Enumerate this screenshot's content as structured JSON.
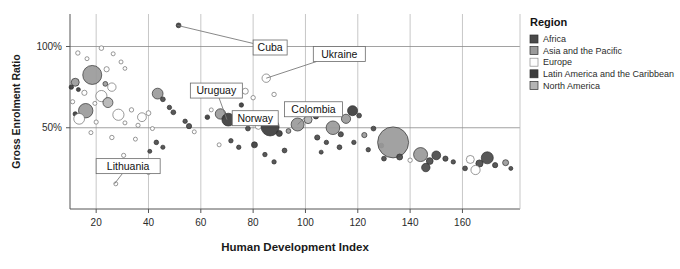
{
  "chart_data": {
    "type": "scatter",
    "title": "",
    "xlabel": "Human Development Index",
    "ylabel": "Gross Enrolment Ratio",
    "xlim": [
      10,
      182
    ],
    "ylim": [
      0,
      120
    ],
    "xticks": [
      20,
      40,
      60,
      80,
      100,
      120,
      140,
      160
    ],
    "xticklabels": [
      "20",
      "40",
      "60",
      "80",
      "100",
      "120",
      "140",
      "160"
    ],
    "yticks": [
      50,
      100
    ],
    "yticklabels": [
      "50%",
      "100%"
    ],
    "grid": "both",
    "legend_position": "right",
    "series": [
      {
        "name": "Africa",
        "color": "#4a4a4a"
      },
      {
        "name": "Asia and the Pacific",
        "color": "#9a9a9a"
      },
      {
        "name": "Europe",
        "color": "#ffffff"
      },
      {
        "name": "Latin America and the Caribbean",
        "color": "#3c3c3c"
      },
      {
        "name": "North America",
        "color": "#b5b5b5"
      }
    ],
    "annotations": [
      {
        "label": "Cuba",
        "x": 51.0,
        "y": 113.0,
        "box_x": 80.0,
        "box_y": 104.0
      },
      {
        "label": "Ukraine",
        "x": 85.0,
        "y": 80.5,
        "box_x": 103.0,
        "box_y": 100.0
      },
      {
        "label": "Uruguay",
        "x": 70.0,
        "y": 55.0,
        "box_x": 56.0,
        "box_y": 77.5
      },
      {
        "label": "Colombia",
        "x": 97.0,
        "y": 52.0,
        "box_x": 92.0,
        "box_y": 66.0
      },
      {
        "label": "Norway",
        "x": 82.0,
        "y": 51.0,
        "box_x": 72.0,
        "box_y": 60.5
      },
      {
        "label": "Lithuania",
        "x": 27.0,
        "y": 15.5,
        "box_x": 20.0,
        "box_y": 31.0
      }
    ],
    "points": [
      {
        "x": 13.0,
        "y": 96.0,
        "r": 2.2,
        "g": "Europe"
      },
      {
        "x": 16.5,
        "y": 92.5,
        "r": 2.0,
        "g": "Europe"
      },
      {
        "x": 22.0,
        "y": 99.0,
        "r": 2.3,
        "g": "Europe"
      },
      {
        "x": 26.5,
        "y": 95.5,
        "r": 2.0,
        "g": "Europe"
      },
      {
        "x": 29.5,
        "y": 90.5,
        "r": 2.0,
        "g": "Europe"
      },
      {
        "x": 24.0,
        "y": 86.0,
        "r": 2.6,
        "g": "Europe"
      },
      {
        "x": 31.0,
        "y": 86.5,
        "r": 1.9,
        "g": "Europe"
      },
      {
        "x": 18.5,
        "y": 82.5,
        "r": 9.5,
        "g": "Asia and the Pacific"
      },
      {
        "x": 23.5,
        "y": 77.0,
        "r": 2.4,
        "g": "Asia and the Pacific"
      },
      {
        "x": 12.0,
        "y": 78.0,
        "r": 4.0,
        "g": "Asia and the Pacific"
      },
      {
        "x": 10.5,
        "y": 75.0,
        "r": 2.2,
        "g": "Latin America and the Caribbean"
      },
      {
        "x": 13.2,
        "y": 73.5,
        "r": 2.0,
        "g": "Latin America and the Caribbean"
      },
      {
        "x": 15.5,
        "y": 71.5,
        "r": 2.6,
        "g": "Europe"
      },
      {
        "x": 26.0,
        "y": 75.0,
        "r": 4.2,
        "g": "Europe"
      },
      {
        "x": 22.0,
        "y": 69.5,
        "r": 5.6,
        "g": "Europe"
      },
      {
        "x": 24.5,
        "y": 65.5,
        "r": 5.0,
        "g": "North America"
      },
      {
        "x": 19.5,
        "y": 65.0,
        "r": 2.0,
        "g": "Europe"
      },
      {
        "x": 11.0,
        "y": 66.0,
        "r": 2.1,
        "g": "Europe"
      },
      {
        "x": 16.0,
        "y": 60.5,
        "r": 7.2,
        "g": "Asia and the Pacific"
      },
      {
        "x": 12.0,
        "y": 58.5,
        "r": 2.2,
        "g": "Latin America and the Caribbean"
      },
      {
        "x": 13.5,
        "y": 55.5,
        "r": 5.4,
        "g": "Europe"
      },
      {
        "x": 28.5,
        "y": 58.0,
        "r": 5.6,
        "g": "Europe"
      },
      {
        "x": 33.5,
        "y": 61.0,
        "r": 2.2,
        "g": "Europe"
      },
      {
        "x": 20.0,
        "y": 53.5,
        "r": 2.1,
        "g": "Europe"
      },
      {
        "x": 31.0,
        "y": 53.0,
        "r": 2.0,
        "g": "Europe"
      },
      {
        "x": 37.5,
        "y": 56.5,
        "r": 4.4,
        "g": "Europe"
      },
      {
        "x": 40.0,
        "y": 59.0,
        "r": 2.4,
        "g": "Europe"
      },
      {
        "x": 36.0,
        "y": 51.5,
        "r": 2.1,
        "g": "Europe"
      },
      {
        "x": 43.5,
        "y": 71.0,
        "r": 5.4,
        "g": "Asia and the Pacific"
      },
      {
        "x": 45.5,
        "y": 67.5,
        "r": 2.4,
        "g": "Africa"
      },
      {
        "x": 41.5,
        "y": 49.5,
        "r": 2.0,
        "g": "Europe"
      },
      {
        "x": 18.0,
        "y": 47.0,
        "r": 2.0,
        "g": "Europe"
      },
      {
        "x": 26.0,
        "y": 44.0,
        "r": 2.2,
        "g": "Europe"
      },
      {
        "x": 35.0,
        "y": 43.0,
        "r": 2.0,
        "g": "Europe"
      },
      {
        "x": 48.0,
        "y": 62.5,
        "r": 2.2,
        "g": "Africa"
      },
      {
        "x": 49.5,
        "y": 59.5,
        "r": 2.4,
        "g": "Africa"
      },
      {
        "x": 51.5,
        "y": 113.0,
        "r": 2.4,
        "g": "Latin America and the Caribbean"
      },
      {
        "x": 43.0,
        "y": 41.0,
        "r": 2.3,
        "g": "Africa"
      },
      {
        "x": 45.5,
        "y": 38.0,
        "r": 2.1,
        "g": "Africa"
      },
      {
        "x": 40.5,
        "y": 35.5,
        "r": 2.0,
        "g": "Africa"
      },
      {
        "x": 30.5,
        "y": 33.0,
        "r": 2.1,
        "g": "Europe"
      },
      {
        "x": 36.0,
        "y": 26.0,
        "r": 2.0,
        "g": "Africa"
      },
      {
        "x": 40.0,
        "y": 22.5,
        "r": 2.1,
        "g": "Europe"
      },
      {
        "x": 27.5,
        "y": 15.5,
        "r": 2.0,
        "g": "Europe"
      },
      {
        "x": 54.0,
        "y": 54.0,
        "r": 2.2,
        "g": "Africa"
      },
      {
        "x": 55.5,
        "y": 51.0,
        "r": 2.6,
        "g": "Africa"
      },
      {
        "x": 57.5,
        "y": 47.5,
        "r": 2.0,
        "g": "Europe"
      },
      {
        "x": 62.5,
        "y": 56.5,
        "r": 2.3,
        "g": "Latin America and the Caribbean"
      },
      {
        "x": 64.0,
        "y": 61.0,
        "r": 2.0,
        "g": "Europe"
      },
      {
        "x": 67.5,
        "y": 58.5,
        "r": 5.2,
        "g": "Asia and the Pacific"
      },
      {
        "x": 70.5,
        "y": 55.0,
        "r": 6.4,
        "g": "Latin America and the Caribbean"
      },
      {
        "x": 73.5,
        "y": 70.0,
        "r": 2.4,
        "g": "Europe"
      },
      {
        "x": 77.0,
        "y": 72.5,
        "r": 3.0,
        "g": "Europe"
      },
      {
        "x": 80.0,
        "y": 68.5,
        "r": 2.2,
        "g": "Europe"
      },
      {
        "x": 75.5,
        "y": 64.0,
        "r": 2.2,
        "g": "Latin America and the Caribbean"
      },
      {
        "x": 85.0,
        "y": 80.5,
        "r": 4.2,
        "g": "Europe"
      },
      {
        "x": 88.0,
        "y": 70.5,
        "r": 2.2,
        "g": "Europe"
      },
      {
        "x": 78.0,
        "y": 49.5,
        "r": 2.4,
        "g": "Africa"
      },
      {
        "x": 82.0,
        "y": 51.0,
        "r": 3.2,
        "g": "Europe"
      },
      {
        "x": 86.5,
        "y": 50.5,
        "r": 9.0,
        "g": "Latin America and the Caribbean"
      },
      {
        "x": 90.0,
        "y": 46.5,
        "r": 3.0,
        "g": "Latin America and the Caribbean"
      },
      {
        "x": 93.5,
        "y": 48.0,
        "r": 2.4,
        "g": "Asia and the Pacific"
      },
      {
        "x": 97.0,
        "y": 52.0,
        "r": 6.5,
        "g": "Asia and the Pacific"
      },
      {
        "x": 101.0,
        "y": 55.0,
        "r": 4.0,
        "g": "North America"
      },
      {
        "x": 95.0,
        "y": 58.5,
        "r": 2.2,
        "g": "Asia and the Pacific"
      },
      {
        "x": 99.0,
        "y": 62.5,
        "r": 3.4,
        "g": "North America"
      },
      {
        "x": 104.5,
        "y": 44.0,
        "r": 2.6,
        "g": "Africa"
      },
      {
        "x": 108.0,
        "y": 41.0,
        "r": 2.2,
        "g": "Africa"
      },
      {
        "x": 71.5,
        "y": 42.0,
        "r": 2.2,
        "g": "Africa"
      },
      {
        "x": 67.0,
        "y": 39.5,
        "r": 2.0,
        "g": "Europe"
      },
      {
        "x": 74.5,
        "y": 38.0,
        "r": 2.2,
        "g": "Africa"
      },
      {
        "x": 80.5,
        "y": 39.5,
        "r": 3.0,
        "g": "Latin America and the Caribbean"
      },
      {
        "x": 84.5,
        "y": 33.5,
        "r": 2.2,
        "g": "Africa"
      },
      {
        "x": 92.0,
        "y": 36.0,
        "r": 2.4,
        "g": "Africa"
      },
      {
        "x": 88.0,
        "y": 29.0,
        "r": 2.2,
        "g": "Africa"
      },
      {
        "x": 104.0,
        "y": 57.0,
        "r": 2.6,
        "g": "Africa"
      },
      {
        "x": 110.5,
        "y": 50.0,
        "r": 6.8,
        "g": "Asia and the Pacific"
      },
      {
        "x": 113.5,
        "y": 46.0,
        "r": 2.6,
        "g": "Africa"
      },
      {
        "x": 115.5,
        "y": 55.5,
        "r": 4.6,
        "g": "Asia and the Pacific"
      },
      {
        "x": 118.0,
        "y": 60.5,
        "r": 5.0,
        "g": "Latin America and the Caribbean"
      },
      {
        "x": 120.5,
        "y": 57.5,
        "r": 2.4,
        "g": "Africa"
      },
      {
        "x": 113.0,
        "y": 38.0,
        "r": 2.4,
        "g": "Africa"
      },
      {
        "x": 118.5,
        "y": 41.0,
        "r": 2.2,
        "g": "Africa"
      },
      {
        "x": 106.0,
        "y": 35.0,
        "r": 2.0,
        "g": "Africa"
      },
      {
        "x": 122.5,
        "y": 45.5,
        "r": 2.6,
        "g": "Asia and the Pacific"
      },
      {
        "x": 126.0,
        "y": 49.5,
        "r": 2.4,
        "g": "Africa"
      },
      {
        "x": 124.0,
        "y": 36.5,
        "r": 2.2,
        "g": "Africa"
      },
      {
        "x": 129.0,
        "y": 39.0,
        "r": 2.4,
        "g": "Africa"
      },
      {
        "x": 133.5,
        "y": 41.0,
        "r": 15.5,
        "g": "Asia and the Pacific"
      },
      {
        "x": 136.0,
        "y": 32.0,
        "r": 3.0,
        "g": "Africa"
      },
      {
        "x": 130.0,
        "y": 31.0,
        "r": 2.4,
        "g": "Africa"
      },
      {
        "x": 140.0,
        "y": 30.0,
        "r": 2.2,
        "g": "Europe"
      },
      {
        "x": 144.0,
        "y": 33.5,
        "r": 7.0,
        "g": "Asia and the Pacific"
      },
      {
        "x": 147.5,
        "y": 29.5,
        "r": 3.4,
        "g": "Africa"
      },
      {
        "x": 150.0,
        "y": 33.0,
        "r": 4.4,
        "g": "Africa"
      },
      {
        "x": 153.5,
        "y": 31.0,
        "r": 2.6,
        "g": "Africa"
      },
      {
        "x": 146.0,
        "y": 25.5,
        "r": 4.2,
        "g": "Africa"
      },
      {
        "x": 156.5,
        "y": 29.0,
        "r": 2.2,
        "g": "Africa"
      },
      {
        "x": 163.0,
        "y": 30.5,
        "r": 4.0,
        "g": "Europe"
      },
      {
        "x": 166.5,
        "y": 28.0,
        "r": 3.6,
        "g": "Africa"
      },
      {
        "x": 169.5,
        "y": 31.5,
        "r": 6.0,
        "g": "Africa"
      },
      {
        "x": 165.0,
        "y": 24.0,
        "r": 4.6,
        "g": "Europe"
      },
      {
        "x": 172.5,
        "y": 27.0,
        "r": 2.6,
        "g": "Africa"
      },
      {
        "x": 176.5,
        "y": 28.5,
        "r": 3.0,
        "g": "Asia and the Pacific"
      },
      {
        "x": 161.0,
        "y": 25.0,
        "r": 2.4,
        "g": "Africa"
      },
      {
        "x": 178.5,
        "y": 25.0,
        "r": 2.0,
        "g": "Africa"
      }
    ]
  },
  "legend": {
    "title": "Region",
    "items": [
      {
        "label": "Africa",
        "color": "#4a4a4a"
      },
      {
        "label": "Asia and the Pacific",
        "color": "#9a9a9a"
      },
      {
        "label": "Europe",
        "color": "#fdfdfd"
      },
      {
        "label": "Latin America and the Caribbean",
        "color": "#3c3c3c"
      },
      {
        "label": "North America",
        "color": "#b5b5b5"
      }
    ]
  }
}
